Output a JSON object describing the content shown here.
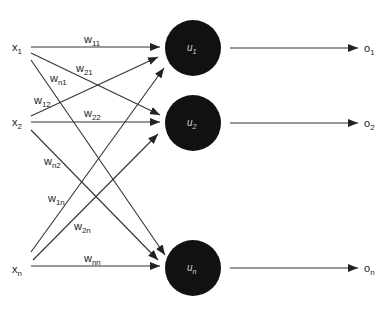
{
  "colors": {
    "neuron": "#111111",
    "edge": "#333333",
    "text": "#222222",
    "neuron_text": "#cfcfcf"
  },
  "inputs": [
    {
      "id": "x1",
      "base": "x",
      "sub": "1",
      "x": 12,
      "y": 51
    },
    {
      "id": "x2",
      "base": "x",
      "sub": "2",
      "x": 12,
      "y": 126
    },
    {
      "id": "xn",
      "base": "x",
      "sub": "n",
      "x": 12,
      "y": 273
    }
  ],
  "neurons": [
    {
      "id": "u1",
      "base": "u",
      "sub": "1",
      "cx": 193,
      "cy": 48,
      "r": 28
    },
    {
      "id": "u2",
      "base": "u",
      "sub": "2",
      "cx": 193,
      "cy": 123,
      "r": 28
    },
    {
      "id": "un",
      "base": "u",
      "sub": "n",
      "cx": 193,
      "cy": 268,
      "r": 28
    }
  ],
  "outputs": [
    {
      "id": "o1",
      "base": "o",
      "sub": "1",
      "x1": 230,
      "y": 48,
      "x2": 358,
      "lx": 364
    },
    {
      "id": "o2",
      "base": "o",
      "sub": "2",
      "x1": 230,
      "y": 123,
      "x2": 358,
      "lx": 364
    },
    {
      "id": "on",
      "base": "o",
      "sub": "n",
      "x1": 230,
      "y": 268,
      "x2": 358,
      "lx": 364
    }
  ],
  "edges": [
    {
      "id": "w11",
      "base": "w",
      "sub": "11",
      "x1": 31,
      "y1": 47,
      "x2": 160,
      "y2": 47,
      "lx": 84,
      "ly": 43
    },
    {
      "id": "w21",
      "base": "w",
      "sub": "21",
      "x1": 31,
      "y1": 53,
      "x2": 160,
      "y2": 115,
      "lx": 76,
      "ly": 72
    },
    {
      "id": "wn1",
      "base": "w",
      "sub": "n1",
      "x1": 31,
      "y1": 60,
      "x2": 165,
      "y2": 255,
      "lx": 50,
      "ly": 82
    },
    {
      "id": "w12",
      "base": "w",
      "sub": "12",
      "x1": 31,
      "y1": 116,
      "x2": 158,
      "y2": 57,
      "lx": 34,
      "ly": 104
    },
    {
      "id": "w22",
      "base": "w",
      "sub": "22",
      "x1": 31,
      "y1": 122,
      "x2": 160,
      "y2": 122,
      "lx": 84,
      "ly": 117
    },
    {
      "id": "wn2",
      "base": "w",
      "sub": "n2",
      "x1": 31,
      "y1": 130,
      "x2": 158,
      "y2": 260,
      "lx": 44,
      "ly": 165
    },
    {
      "id": "w1n",
      "base": "w",
      "sub": "1n",
      "x1": 31,
      "y1": 252,
      "x2": 164,
      "y2": 68,
      "lx": 48,
      "ly": 202
    },
    {
      "id": "w2n",
      "base": "w",
      "sub": "2n",
      "x1": 33,
      "y1": 260,
      "x2": 158,
      "y2": 134,
      "lx": 74,
      "ly": 230
    },
    {
      "id": "wnn",
      "base": "w",
      "sub": "nn",
      "x1": 31,
      "y1": 266,
      "x2": 160,
      "y2": 266,
      "lx": 84,
      "ly": 262
    }
  ]
}
